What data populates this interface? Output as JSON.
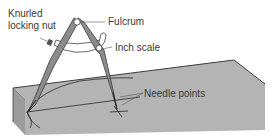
{
  "figure": {
    "labels": {
      "knurled_line1": "Knurled",
      "knurled_line2": "locking nut",
      "fulcrum": "Fulcrum",
      "inch_scale": "Inch scale",
      "needle_points": "Needle points"
    },
    "colors": {
      "slab_top": "#b4b4b4",
      "slab_side": "#a6a6a6",
      "slab_front": "#9c9c9c",
      "leg": "#8c8c8c",
      "outline": "#2a2a2a",
      "leader": "#555555",
      "text": "#3a3a3a"
    }
  }
}
